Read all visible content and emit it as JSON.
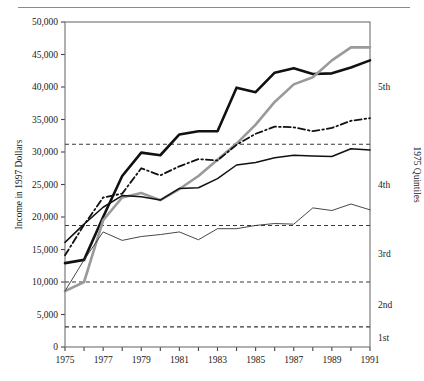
{
  "figure": {
    "has_top_rule": true,
    "background": "#ffffff",
    "ink": "#1a1a1a"
  },
  "chart_data": {
    "type": "line",
    "title": "",
    "xlabel": "",
    "ylabel": "Income in 1997 Dollars",
    "right_axis_label": "1975 Quintiles",
    "xlim": [
      1975,
      1991
    ],
    "ylim": [
      0,
      50000
    ],
    "grid": false,
    "legend": "right-axis-quintile-markers",
    "x": [
      1975,
      1976,
      1977,
      1978,
      1979,
      1980,
      1981,
      1982,
      1983,
      1984,
      1985,
      1986,
      1987,
      1988,
      1989,
      1990,
      1991
    ],
    "yticks": [
      0,
      5000,
      10000,
      15000,
      20000,
      25000,
      30000,
      35000,
      40000,
      45000,
      50000
    ],
    "ytick_labels": [
      "0",
      "5,000",
      "10,000",
      "15,000",
      "20,000",
      "25,000",
      "30,000",
      "35,000",
      "40,000",
      "45,000",
      "50,000"
    ],
    "xticks": [
      1975,
      1976,
      1977,
      1978,
      1979,
      1980,
      1981,
      1982,
      1983,
      1984,
      1985,
      1986,
      1987,
      1988,
      1989,
      1990,
      1991
    ],
    "xtick_labels_shown": [
      "1975",
      "1977",
      "1979",
      "1981",
      "1983",
      "1985",
      "1987",
      "1989",
      "1991"
    ],
    "xtick_labels_shown_values": [
      1975,
      1977,
      1979,
      1981,
      1983,
      1985,
      1987,
      1989,
      1991
    ],
    "quintile_thresholds": {
      "values": [
        3100,
        10000,
        18700,
        31200
      ],
      "labels_between": [
        "1st",
        "2nd",
        "3rd",
        "4th",
        "5th"
      ],
      "label_positions": [
        1500,
        6500,
        14300,
        25000,
        40000
      ],
      "style": "dashed",
      "color": "#3a3a3a"
    },
    "series": [
      {
        "name": "series-thick-black",
        "style": "solid",
        "width": 2.6,
        "color": "#111111",
        "values": [
          12900,
          13400,
          20000,
          26300,
          29900,
          29500,
          32700,
          33200,
          33200,
          39900,
          39200,
          42200,
          42900,
          42000,
          42100,
          43000,
          44100
        ]
      },
      {
        "name": "series-gray",
        "style": "solid",
        "width": 2.6,
        "color": "#9a9a9a",
        "values": [
          8600,
          10000,
          19500,
          23000,
          23700,
          22600,
          24300,
          26300,
          28800,
          31300,
          34200,
          37700,
          40400,
          41500,
          44100,
          46100,
          46100
        ]
      },
      {
        "name": "series-dash-dot",
        "style": "dash-dot",
        "width": 1.8,
        "color": "#111111",
        "values": [
          14100,
          18800,
          23000,
          23600,
          27500,
          26400,
          27800,
          28900,
          28700,
          31100,
          32800,
          33900,
          33800,
          33200,
          33700,
          34800,
          35200
        ]
      },
      {
        "name": "series-medium-black",
        "style": "solid",
        "width": 1.5,
        "color": "#111111",
        "values": [
          16100,
          18900,
          21500,
          23300,
          23100,
          22600,
          24400,
          24500,
          25900,
          28000,
          28400,
          29100,
          29500,
          29400,
          29300,
          30500,
          30300
        ]
      },
      {
        "name": "series-thin-black",
        "style": "solid",
        "width": 0.9,
        "color": "#333333",
        "values": [
          8600,
          13400,
          17700,
          16400,
          17000,
          17300,
          17700,
          16500,
          18200,
          18200,
          18700,
          19000,
          18900,
          21400,
          21000,
          22000,
          21100
        ]
      }
    ]
  }
}
